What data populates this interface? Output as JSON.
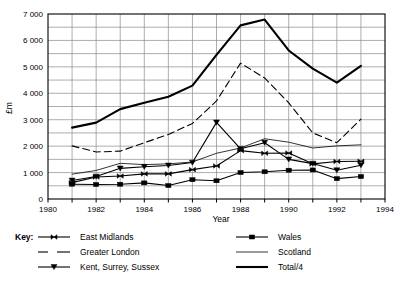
{
  "chart_data": {
    "type": "line",
    "title": "",
    "xlabel": "Year",
    "ylabel": "£m",
    "xlim": [
      1980,
      1994
    ],
    "ylim": [
      0,
      7000
    ],
    "xticks": [
      1980,
      1981,
      1982,
      1983,
      1984,
      1985,
      1986,
      1987,
      1988,
      1989,
      1990,
      1991,
      1992,
      1993,
      1994
    ],
    "xtick_labels": [
      "1980",
      "",
      "1982",
      "",
      "1984",
      "",
      "1986",
      "",
      "1988",
      "",
      "1990",
      "",
      "1992",
      "",
      "1994"
    ],
    "yticks": [
      0,
      500,
      1000,
      1500,
      2000,
      2500,
      3000,
      3500,
      4000,
      4500,
      5000,
      5500,
      6000,
      6500,
      7000
    ],
    "ytick_labels": [
      "0",
      "",
      "1 000",
      "",
      "2 000",
      "",
      "3 000",
      "",
      "4 000",
      "",
      "5 000",
      "",
      "6 000",
      "",
      "7 000"
    ],
    "grid": true,
    "legend_position": "below",
    "x": [
      1981,
      1982,
      1983,
      1984,
      1985,
      1986,
      1987,
      1988,
      1989,
      1990,
      1991,
      1992,
      1993
    ],
    "series": [
      {
        "name": "East Midlands",
        "marker": "bowtie",
        "style": "solid-thin",
        "values": [
          620,
          830,
          870,
          950,
          950,
          1110,
          1250,
          1830,
          1730,
          1740,
          1330,
          1420,
          1430
        ]
      },
      {
        "name": "Greater London",
        "marker": "none",
        "style": "dashed",
        "values": [
          2010,
          1780,
          1810,
          2130,
          2440,
          2860,
          3710,
          5140,
          4580,
          3640,
          2500,
          2130,
          3020
        ]
      },
      {
        "name": "Kent, Surrey, Sussex",
        "marker": "triangle",
        "style": "solid-thin",
        "values": [
          700,
          850,
          1160,
          1220,
          1270,
          1380,
          2900,
          1900,
          2130,
          1500,
          1340,
          1090,
          1280
        ]
      },
      {
        "name": "Wales",
        "marker": "square",
        "style": "solid-thin",
        "values": [
          560,
          550,
          560,
          610,
          510,
          730,
          690,
          1000,
          1030,
          1090,
          1100,
          770,
          850
        ]
      },
      {
        "name": "Scotland",
        "marker": "none",
        "style": "solid-hairline",
        "values": [
          940,
          1080,
          1350,
          1300,
          1330,
          1400,
          1730,
          1930,
          2280,
          2150,
          1930,
          2010,
          2050
        ]
      },
      {
        "name": "Total/4",
        "marker": "none",
        "style": "solid-thick",
        "values": [
          2700,
          2890,
          3400,
          3640,
          3870,
          4290,
          5450,
          6570,
          6790,
          5620,
          4930,
          4400,
          5040
        ]
      }
    ]
  },
  "legend": {
    "key_title": "Key:",
    "entries": [
      {
        "label": "East Midlands"
      },
      {
        "label": "Greater London"
      },
      {
        "label": "Kent, Surrey, Sussex"
      },
      {
        "label": "Wales"
      },
      {
        "label": "Scotland"
      },
      {
        "label": "Total/4"
      }
    ]
  },
  "colors": {
    "line": "#000000",
    "grid": "#8a8a8a",
    "axis": "#000000",
    "background": "#ffffff"
  }
}
